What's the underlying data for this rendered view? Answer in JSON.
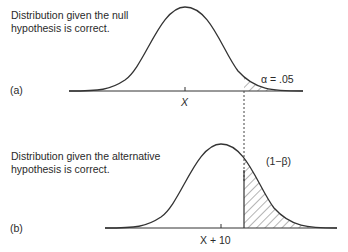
{
  "panel_a": {
    "label": "(a)",
    "caption_line1": "Distribution given the null",
    "caption_line2": "hypothesis is correct.",
    "mean_label": "X",
    "alpha_label": "α = .05"
  },
  "panel_b": {
    "label": "(b)",
    "caption_line1": "Distribution given the alternative",
    "caption_line2": "hypothesis is correct.",
    "mean_label": "X + 10",
    "power_label": "(1−β)"
  },
  "colors": {
    "line": "#333333",
    "text": "#2a2a2a",
    "background": "#ffffff"
  }
}
